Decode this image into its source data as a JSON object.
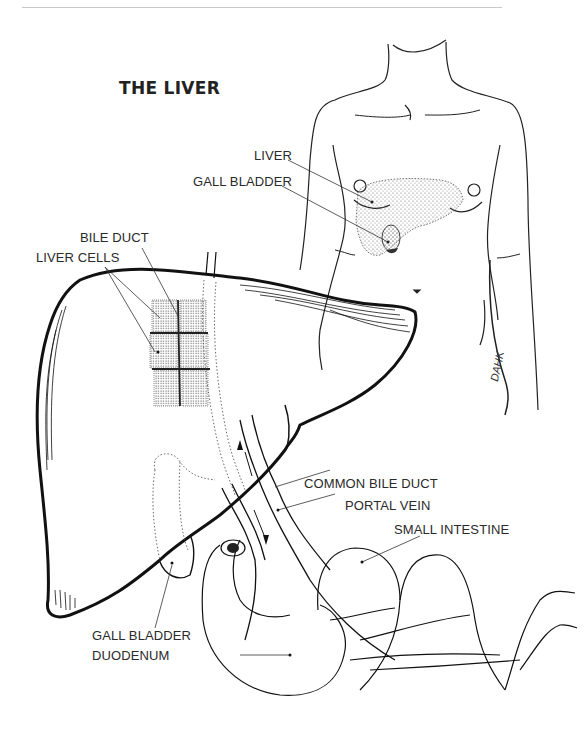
{
  "page": {
    "title": "THE LIVER",
    "signature": "DAHK"
  },
  "labels": {
    "torso_liver": "LIVER",
    "torso_gall_bladder": "GALL BLADDER",
    "bile_duct": "BILE DUCT",
    "liver_cells": "LIVER CELLS",
    "common_bile_duct": "COMMON BILE DUCT",
    "portal_vein": "PORTAL VEIN",
    "small_intestine": "SMALL INTESTINE",
    "gall_bladder": "GALL BLADDER",
    "duodenum": "DUODENUM"
  },
  "colors": {
    "ink": "#1e1e1e",
    "stipple": "#555555",
    "background": "#ffffff"
  }
}
